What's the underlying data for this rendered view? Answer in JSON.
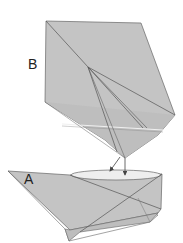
{
  "diagram": {
    "type": "origami-fold-instruction",
    "labels": {
      "piece_b": "B",
      "piece_a": "A"
    },
    "colors": {
      "paper": "#c4c4c4",
      "paper_dark": "#b4b4b4",
      "line": "#555555",
      "highlight": "#f0f0f0",
      "background": "#ffffff"
    }
  }
}
